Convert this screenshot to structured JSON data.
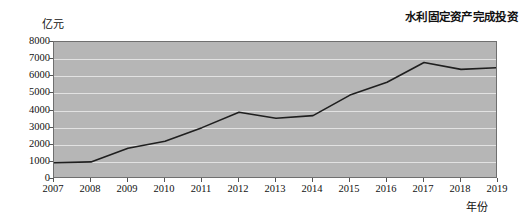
{
  "chart_data": {
    "type": "line",
    "title": "水利固定资产完成投资",
    "xlabel": "年份",
    "ylabel": "亿元",
    "grid": true,
    "legend": "none",
    "xlim": [
      2007,
      2019
    ],
    "ylim": [
      0,
      8000
    ],
    "ytick_step": 1000,
    "categories": [
      2007,
      2008,
      2009,
      2010,
      2011,
      2012,
      2013,
      2014,
      2015,
      2016,
      2017,
      2018,
      2019
    ],
    "x_tick_labels": [
      "2007",
      "2008",
      "2009",
      "2010",
      "2011",
      "2012",
      "2013",
      "2014",
      "2015",
      "2016",
      "2017",
      "2018",
      "2019"
    ],
    "y_tick_labels": [
      "8000",
      "7000",
      "6000",
      "5000",
      "4000",
      "3000",
      "2000",
      "1000",
      "0"
    ],
    "y_tick_values": [
      8000,
      7000,
      6000,
      5000,
      4000,
      3000,
      2000,
      1000,
      0
    ],
    "series": [
      {
        "name": "水利固定资产完成投资",
        "color": "#1f1f1f",
        "values": [
          950,
          1000,
          1800,
          2200,
          3000,
          3900,
          3550,
          3700,
          4900,
          5650,
          6800,
          6400,
          6500
        ]
      }
    ]
  },
  "style": {
    "plot_background": "#b6b6b6",
    "gridline_color": "#e2e2e2",
    "axis_color": "#6f6f6f",
    "line_color": "#1f1f1f",
    "page_background": "#ffffff"
  }
}
